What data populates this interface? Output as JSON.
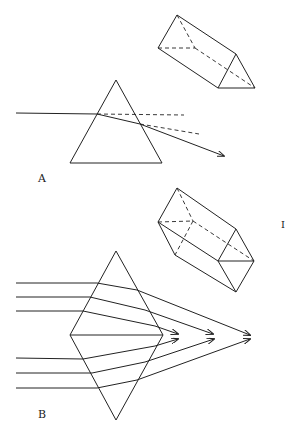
{
  "figure": {
    "panel_a": {
      "label": "A",
      "description": "Triangular prism refracting a single ray; 3D prism view top right"
    },
    "panel_b": {
      "label": "B",
      "description": "Two prisms base-to-base (double prism) converging parallel rays; 3D double prism view top right"
    },
    "side_mark": "I",
    "colors": {
      "line": "#222222",
      "background": "#ffffff"
    }
  }
}
